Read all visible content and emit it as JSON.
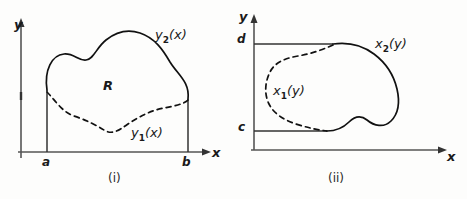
{
  "figure": {
    "ink_color": "#1a1a1a",
    "background_color": "#fdfdfc"
  },
  "panels": [
    {
      "id": "i",
      "caption": "(i)",
      "axes": {
        "y_label": "y",
        "x_label": "x",
        "x_ticks": [
          "a",
          "b"
        ]
      },
      "region_label": "R",
      "curves": [
        {
          "name": "upper-boundary",
          "label_base": "y",
          "label_sub": "2",
          "label_arg": "(x)",
          "style": "solid"
        },
        {
          "name": "lower-boundary",
          "label_base": "y",
          "label_sub": "1",
          "label_arg": "(x)",
          "style": "dashed"
        }
      ]
    },
    {
      "id": "ii",
      "caption": "(ii)",
      "axes": {
        "y_label": "y",
        "x_label": "x",
        "y_ticks": [
          "c",
          "d"
        ]
      },
      "curves": [
        {
          "name": "right-boundary",
          "label_base": "x",
          "label_sub": "2",
          "label_arg": "(y)",
          "style": "solid"
        },
        {
          "name": "left-boundary",
          "label_base": "x",
          "label_sub": "1",
          "label_arg": "(y)",
          "style": "dashed"
        }
      ]
    }
  ]
}
